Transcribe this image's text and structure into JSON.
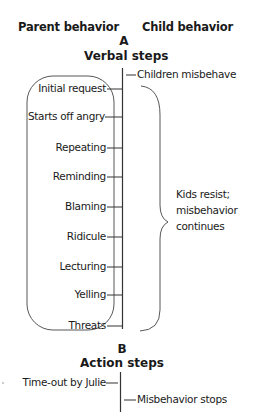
{
  "headers": {
    "parent": "Parent behavior",
    "child": "Child behavior"
  },
  "section_a": {
    "letter": "A",
    "title": "Verbal steps",
    "child_trigger": "Children misbehave",
    "parent_steps": [
      "Initial request",
      "Starts off angry",
      "Repeating",
      "Reminding",
      "Blaming",
      "Ridicule",
      "Lecturing",
      "Yelling",
      "Threats"
    ],
    "child_response": [
      "Kids resist;",
      "misbehavior",
      "continues"
    ]
  },
  "section_b": {
    "letter": "B",
    "title": "Action steps",
    "parent_action": "Time-out by Julie",
    "child_outcome": "Misbehavior stops"
  },
  "colors": {
    "line": "#333333",
    "text": "#1a1a1a"
  }
}
